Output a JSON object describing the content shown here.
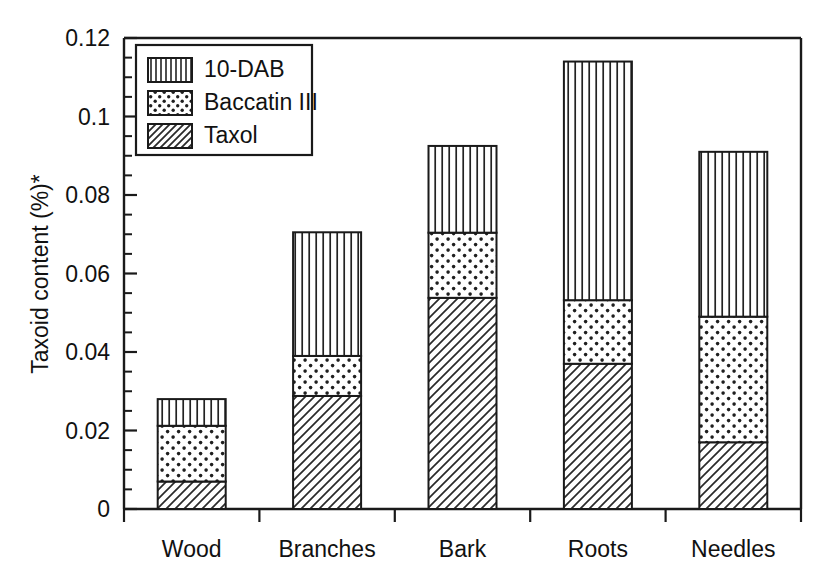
{
  "chart_data": {
    "type": "bar",
    "subtype": "stacked-bar",
    "title": "",
    "xlabel": "",
    "ylabel": "Taxoid content (%)*",
    "categories": [
      "Wood",
      "Branches",
      "Bark",
      "Roots",
      "Needles"
    ],
    "series": [
      {
        "name": "Taxol",
        "pattern": "diagonal-hatch",
        "values": [
          0.007,
          0.0288,
          0.0538,
          0.037,
          0.017
        ]
      },
      {
        "name": "Baccatin III",
        "pattern": "dots",
        "values": [
          0.0142,
          0.0102,
          0.0166,
          0.0162,
          0.032
        ]
      },
      {
        "name": "10-DAB",
        "pattern": "vertical-lines",
        "values": [
          0.0068,
          0.0315,
          0.0221,
          0.0608,
          0.042
        ]
      }
    ],
    "stack_order_bottom_to_top": [
      "Taxol",
      "Baccatin III",
      "10-DAB"
    ],
    "cumulative_tops": {
      "Wood": [
        0.007,
        0.0212,
        0.028
      ],
      "Branches": [
        0.0288,
        0.039,
        0.0705
      ],
      "Bark": [
        0.0538,
        0.0704,
        0.0925
      ],
      "Roots": [
        0.037,
        0.0532,
        0.114
      ],
      "Needles": [
        0.017,
        0.049,
        0.091
      ]
    },
    "totals": [
      0.028,
      0.0705,
      0.0925,
      0.114,
      0.091
    ],
    "ylim": [
      0,
      0.12
    ],
    "ytick_labels": [
      "0",
      "0.02",
      "0.04",
      "0.06",
      "0.08",
      "0.1",
      "0.12"
    ],
    "ytick_values": [
      0,
      0.02,
      0.04,
      0.06,
      0.08,
      0.1,
      0.12
    ],
    "yminor_step": 0.005,
    "grid": false,
    "legend": {
      "position": "top-left-inside",
      "entries": [
        {
          "label": "10-DAB",
          "pattern": "vertical-lines"
        },
        {
          "label": "Baccatin III",
          "pattern": "dots"
        },
        {
          "label": "Taxol",
          "pattern": "diagonal-hatch"
        }
      ]
    },
    "colors": {
      "line": "#1a1a1a",
      "background": "#ffffff",
      "pattern_fill": "#ffffff",
      "pattern_stroke": "#222222"
    }
  }
}
